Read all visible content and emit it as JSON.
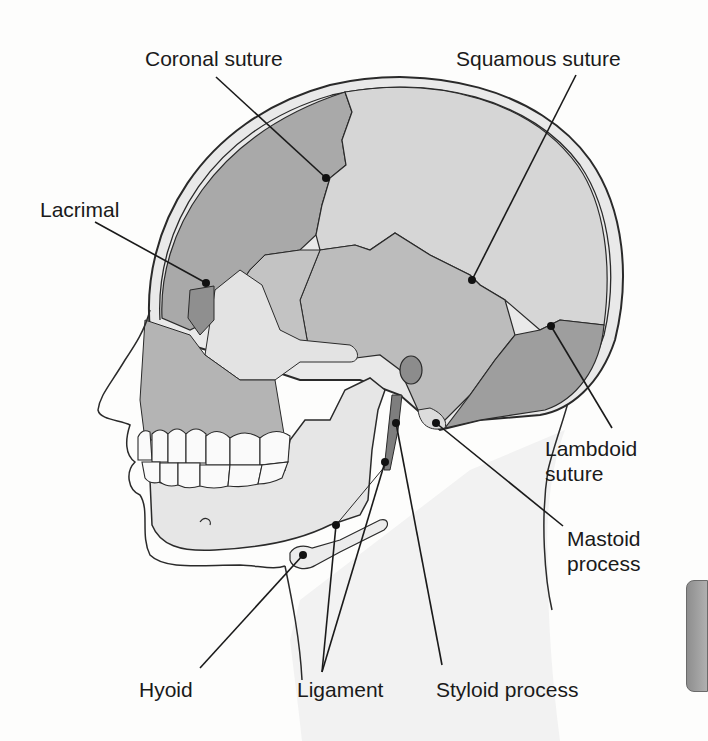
{
  "figure": {
    "colors": {
      "background": "#fdfdfc",
      "skin": "#efefef",
      "frontal_bone": "#a9a9a9",
      "parietal_bone": "#d4d4d4",
      "temporal_bone": "#bdbdbd",
      "occipital_bone": "#9e9e9e",
      "zygomatic_bone": "#e3e3e3",
      "mandible": "#e6e6e6",
      "outline": "#2a2a2a",
      "label_text": "#1a1a1a",
      "side_tab": "#9a9a9a"
    }
  },
  "labels": {
    "coronal_suture": "Coronal suture",
    "squamous_suture": "Squamous suture",
    "lacrimal": "Lacrimal",
    "lambdoid_suture": [
      "Lambdoid",
      "suture"
    ],
    "mastoid_process": [
      "Mastoid",
      "process"
    ],
    "hyoid": "Hyoid",
    "ligament": "Ligament",
    "styloid_process": "Styloid process"
  }
}
